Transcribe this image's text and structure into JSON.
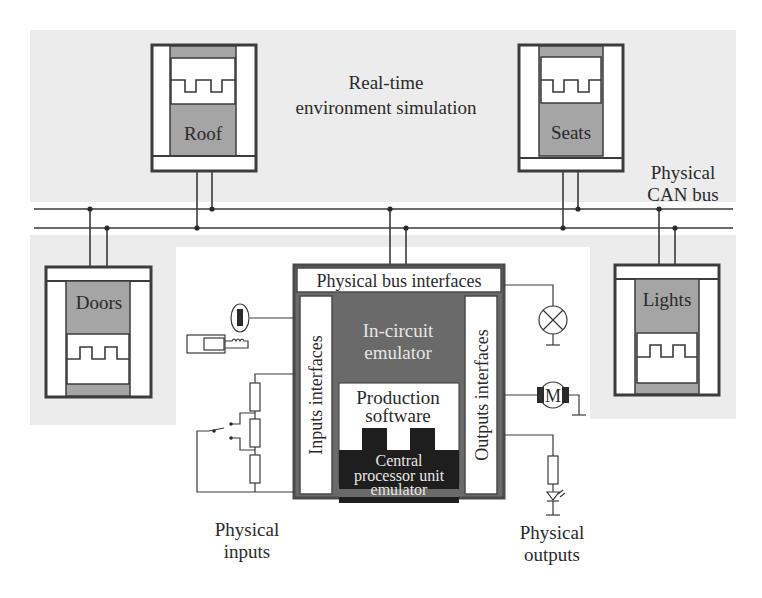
{
  "diagram": {
    "title": "Real-time environment simulation",
    "title_lines": [
      "Real-time",
      "environment simulation"
    ],
    "bus": {
      "label_lines": [
        "Physical",
        "CAN bus"
      ]
    },
    "ecus": [
      {
        "id": "roof",
        "label": "Roof"
      },
      {
        "id": "seats",
        "label": "Seats"
      },
      {
        "id": "doors",
        "label": "Doors"
      },
      {
        "id": "lights",
        "label": "Lights"
      }
    ],
    "emulator": {
      "bus_interfaces": "Physical bus interfaces",
      "inputs_interfaces": "Inputs interfaces",
      "outputs_interfaces": "Outputs interfaces",
      "in_circuit_lines": [
        "In-circuit",
        "emulator"
      ],
      "production_software_lines": [
        "Production",
        "software"
      ],
      "cpu_emulator_lines": [
        "Central",
        "processor unit",
        "emulator"
      ]
    },
    "physical_inputs": {
      "label_lines": [
        "Physical",
        "inputs"
      ],
      "components": [
        "hall-sensor",
        "ignition-key",
        "resistor-divider-switch"
      ]
    },
    "physical_outputs": {
      "label_lines": [
        "Physical",
        "outputs"
      ],
      "components": [
        "lamp",
        "motor",
        "resistor-led"
      ],
      "motor_letter": "M"
    },
    "colors": {
      "background_grey": "#ececec",
      "ecu_grey": "#a5a5a5",
      "emulator_dark": "#6a6a6a",
      "cpu_black": "#1e1e1e",
      "line": "#3a3a3a"
    }
  }
}
